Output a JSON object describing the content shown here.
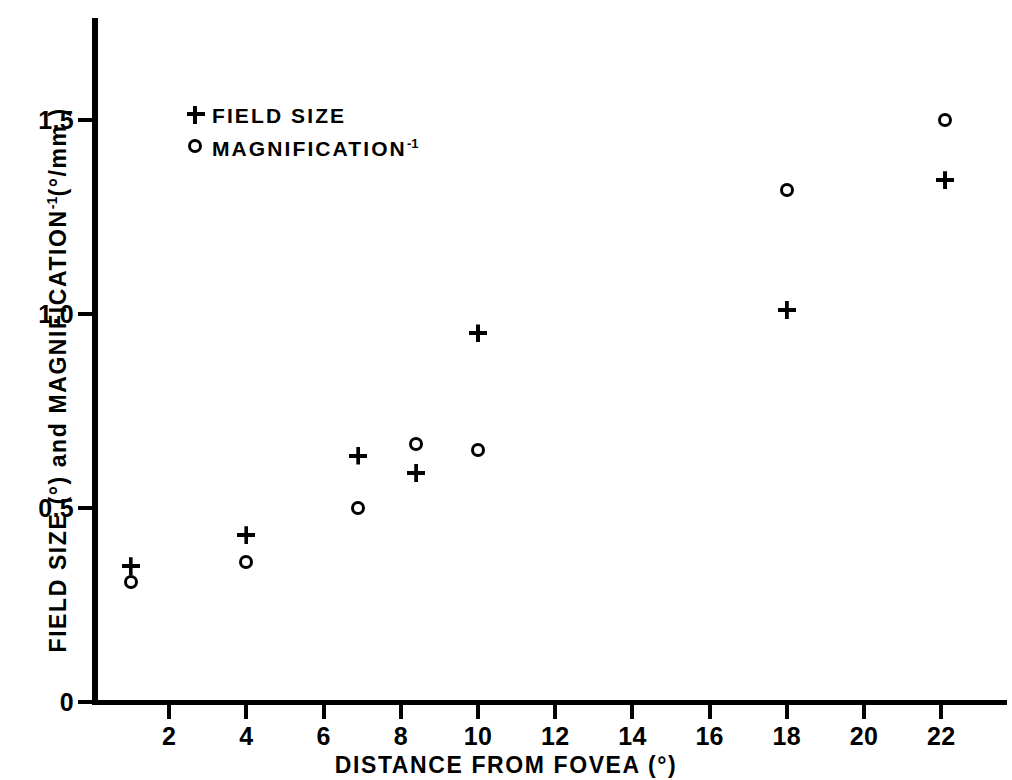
{
  "chart_data": {
    "type": "scatter",
    "title": "",
    "xlabel": "DISTANCE FROM FOVEA (°)",
    "ylabel": "FIELD SIZE (°) and MAGNIFICATION⁻¹(°/mm)",
    "ylabel_parts": {
      "lead": "FIELD SIZE (°) and MAGNIFICATION",
      "exponent": "-1",
      "tail": "(°/mm )"
    },
    "xlim": [
      0,
      23.5
    ],
    "ylim": [
      0,
      1.72
    ],
    "grid": false,
    "legend_position": "upper-left-inside",
    "xticks": [
      2,
      4,
      6,
      8,
      10,
      12,
      14,
      16,
      18,
      20,
      22
    ],
    "xtick_labels": [
      "2",
      "4",
      "6",
      "8",
      "10",
      "12",
      "14",
      "16",
      "18",
      "20",
      "22"
    ],
    "yticks": [
      0,
      0.5,
      1.0,
      1.5
    ],
    "ytick_labels": [
      "0",
      "0.5",
      "1.0",
      "1.5"
    ],
    "series": [
      {
        "name": "FIELD SIZE",
        "marker": "plus",
        "points": [
          {
            "x": 1.0,
            "y": 0.35
          },
          {
            "x": 4.0,
            "y": 0.43
          },
          {
            "x": 6.9,
            "y": 0.635
          },
          {
            "x": 8.4,
            "y": 0.59
          },
          {
            "x": 10.0,
            "y": 0.95
          },
          {
            "x": 18.0,
            "y": 1.01
          },
          {
            "x": 22.1,
            "y": 1.345
          }
        ]
      },
      {
        "name": "MAGNIFICATION⁻¹",
        "marker": "circle",
        "points": [
          {
            "x": 1.0,
            "y": 0.31
          },
          {
            "x": 4.0,
            "y": 0.36
          },
          {
            "x": 6.9,
            "y": 0.5
          },
          {
            "x": 8.4,
            "y": 0.665
          },
          {
            "x": 10.0,
            "y": 0.65
          },
          {
            "x": 18.0,
            "y": 1.32
          },
          {
            "x": 22.1,
            "y": 1.5
          }
        ]
      }
    ]
  },
  "legend": {
    "items": [
      {
        "marker": "plus",
        "label": "FIELD SIZE",
        "exponent": ""
      },
      {
        "marker": "circle",
        "label": "MAGNIFICATION",
        "exponent": "-1"
      }
    ]
  },
  "colors": {
    "ink": "#000000",
    "background": "#ffffff"
  }
}
